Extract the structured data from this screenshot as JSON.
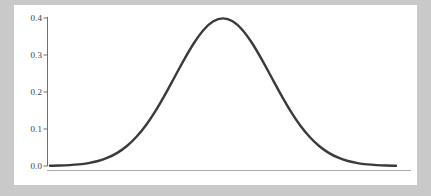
{
  "figure": {
    "name": "normal-distribution-plot",
    "background_color": "#c9c9c9",
    "panel_color": "#ffffff",
    "curve_color": "#3a3a3a",
    "axis_color": "#aaaaaa",
    "tick_color": "#6e6e6e",
    "label_color": "#3c3c3c"
  },
  "chart_data": {
    "type": "line",
    "title": "",
    "subtitle": "",
    "xlabel": "",
    "ylabel": "",
    "xlim": [
      -3.6,
      3.6
    ],
    "ylim": [
      0.0,
      0.42
    ],
    "grid": false,
    "legend": null,
    "legend_position": "none",
    "x_axis_visible_spine": false,
    "y_axis_visible_spine": true,
    "xticks": [],
    "xticklabels": [],
    "yticks": [
      0.0,
      0.1,
      0.2,
      0.3,
      0.4
    ],
    "yticklabels": [
      "0.0",
      "0.1",
      "0.2",
      "0.3",
      "0.4"
    ],
    "annotations": [],
    "series": [
      {
        "name": "standard normal pdf",
        "color": "#3a3a3a",
        "linewidth": 2.4,
        "x": [
          -3.6,
          -3.4,
          -3.2,
          -3.0,
          -2.8,
          -2.6,
          -2.4,
          -2.2,
          -2.0,
          -1.8,
          -1.6,
          -1.4,
          -1.2,
          -1.0,
          -0.8,
          -0.6,
          -0.4,
          -0.2,
          0.0,
          0.2,
          0.4,
          0.6,
          0.8,
          1.0,
          1.2,
          1.4,
          1.6,
          1.8,
          2.0,
          2.2,
          2.4,
          2.6,
          2.8,
          3.0,
          3.2,
          3.4,
          3.6
        ],
        "y": [
          0.0006,
          0.0012,
          0.0024,
          0.0044,
          0.0079,
          0.0136,
          0.0224,
          0.0355,
          0.054,
          0.079,
          0.1109,
          0.1497,
          0.1942,
          0.242,
          0.2897,
          0.3332,
          0.3683,
          0.391,
          0.3989,
          0.391,
          0.3683,
          0.3332,
          0.2897,
          0.242,
          0.1942,
          0.1497,
          0.1109,
          0.079,
          0.054,
          0.0355,
          0.0224,
          0.0136,
          0.0079,
          0.0044,
          0.0024,
          0.0012,
          0.0006
        ]
      }
    ],
    "peak": {
      "x": 0.0,
      "y": 0.3989
    }
  },
  "axis": {
    "y_tick_labels": [
      {
        "value": "0.4",
        "y_px": 18
      },
      {
        "value": "0.3",
        "y_px": 55
      },
      {
        "value": "0.2",
        "y_px": 92
      },
      {
        "value": "0.1",
        "y_px": 129
      },
      {
        "value": "0.0",
        "y_px": 166
      }
    ]
  }
}
